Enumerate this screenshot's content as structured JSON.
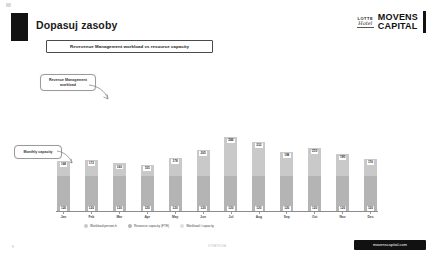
{
  "slide": {
    "title": "Dopasuj zasoby",
    "subtitle": "Revevenue Management workload vs resource capacity",
    "page_number": "9"
  },
  "logo": {
    "lotte_top": "LOTTE",
    "lotte_script": "Hotel",
    "movens_line1": "MOVENS",
    "movens_line2": "CAPITAL"
  },
  "callouts": {
    "workload": "Revenue Management workload",
    "capacity": "Monthly capacity"
  },
  "footer": {
    "badge": "movenscapital.com",
    "center": "STRATEGIA"
  },
  "chart_data": {
    "type": "bar",
    "title": "Revevenue Management workload vs resource capacity",
    "xlabel": "",
    "ylabel": "",
    "grid": false,
    "legend_position": "bottom",
    "categories": [
      "Jan",
      "Feb",
      "Mar",
      "Apr",
      "May",
      "Jun",
      "Jul",
      "Aug",
      "Sep",
      "Oct",
      "Nov",
      "Dec"
    ],
    "series": [
      {
        "name": "Workload person-h",
        "color": "#c9c9c9",
        "values": [
          168,
          172,
          160,
          155,
          178,
          205,
          246,
          232,
          198,
          210,
          190,
          176
        ]
      },
      {
        "name": "Resource capacity (FTE)",
        "color": "#b4b4b4",
        "values": [
          120,
          120,
          120,
          120,
          120,
          120,
          120,
          120,
          120,
          120,
          120,
          120
        ]
      }
    ],
    "top_labels": [
      "168",
      "172",
      "160",
      "155",
      "178",
      "205",
      "246",
      "232",
      "198",
      "210",
      "190",
      "176"
    ],
    "bottom_labels": [
      "120",
      "120",
      "120",
      "120",
      "120",
      "120",
      "120",
      "120",
      "120",
      "120",
      "120",
      "120"
    ],
    "legend": [
      {
        "label": "Workload person-h",
        "color": "#c9c9c9"
      },
      {
        "label": "Resource capacity (FTE)",
        "color": "#b4b4b4"
      },
      {
        "label": "Workload / capacity",
        "color": "#e0e0e0"
      }
    ],
    "ylim": [
      0,
      260
    ]
  }
}
